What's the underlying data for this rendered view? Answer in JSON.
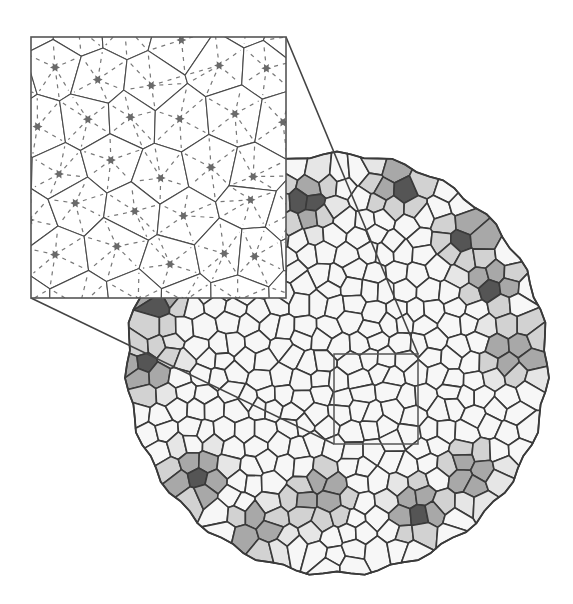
{
  "figure": {
    "width": 573,
    "height": 604,
    "background": "#ffffff",
    "edge_color": "#3a3a3a",
    "cell_fill": "#f7f7f7"
  },
  "disk": {
    "cx": 337,
    "cy": 364,
    "r": 210,
    "cell_spacing": 20,
    "shade_levels": {
      "dark": "#555555",
      "medium": "#a8a8a8",
      "light": "#d2d2d2",
      "faint": "#e6e6e6"
    },
    "clusters": [
      {
        "x": 306,
        "y": 200,
        "label": "cluster-1"
      },
      {
        "x": 400,
        "y": 185,
        "label": "cluster-2"
      },
      {
        "x": 468,
        "y": 240,
        "label": "cluster-3"
      },
      {
        "x": 495,
        "y": 283,
        "label": "cluster-4"
      },
      {
        "x": 515,
        "y": 352,
        "label": "cluster-5"
      },
      {
        "x": 148,
        "y": 370,
        "label": "cluster-6"
      },
      {
        "x": 468,
        "y": 473,
        "label": "cluster-7"
      },
      {
        "x": 418,
        "y": 511,
        "label": "cluster-8"
      },
      {
        "x": 320,
        "y": 497,
        "label": "cluster-9"
      },
      {
        "x": 255,
        "y": 532,
        "label": "cluster-10"
      },
      {
        "x": 195,
        "y": 477,
        "label": "cluster-11"
      },
      {
        "x": 160,
        "y": 307,
        "label": "cluster-12"
      }
    ]
  },
  "zoom_region": {
    "x": 334,
    "y": 354,
    "width": 84,
    "height": 90
  },
  "inset": {
    "x": 31,
    "y": 37,
    "width": 255,
    "height": 261,
    "border_color": "#555555",
    "site_color": "#6a6a6a",
    "dash_color": "#777777",
    "cell_spacing": 52
  },
  "connectors": [
    {
      "from": [
        286,
        37
      ],
      "to": [
        418,
        354
      ]
    },
    {
      "from": [
        31,
        298
      ],
      "to": [
        334,
        444
      ]
    }
  ]
}
